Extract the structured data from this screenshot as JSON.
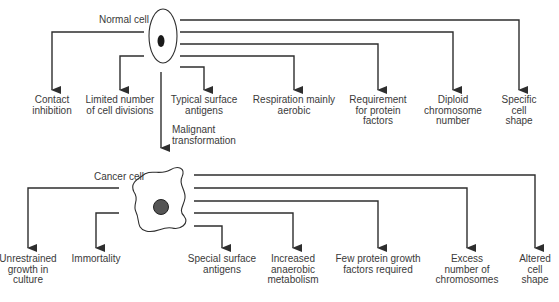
{
  "diagram": {
    "normal_cell": {
      "label": "Normal cell",
      "properties": [
        {
          "id": "contact-inhibition",
          "label": "Contact\ninhibition"
        },
        {
          "id": "limited-divisions",
          "label": "Limited number\nof cell divisions"
        },
        {
          "id": "typical-antigens",
          "label": "Typical surface\nantigens"
        },
        {
          "id": "aerobic-respiration",
          "label": "Respiration mainly\naerobic"
        },
        {
          "id": "protein-factors",
          "label": "Requirement\nfor protein\nfactors"
        },
        {
          "id": "diploid",
          "label": "Diploid\nchromosome\nnumber"
        },
        {
          "id": "specific-shape",
          "label": "Specific\ncell\nshape"
        }
      ]
    },
    "transition": {
      "label": "Malignant\ntransformation"
    },
    "cancer_cell": {
      "label": "Cancer cell",
      "properties": [
        {
          "id": "unrestrained-growth",
          "label": "Unrestrained\ngrowth in\nculture"
        },
        {
          "id": "immortality",
          "label": "Immortality"
        },
        {
          "id": "special-antigens",
          "label": "Special surface\nantigens"
        },
        {
          "id": "anaerobic-metabolism",
          "label": "Increased\nanaerobic\nmetabolism"
        },
        {
          "id": "few-growth-factors",
          "label": "Few protein growth\nfactors required"
        },
        {
          "id": "excess-chromosomes",
          "label": "Excess\nnumber of\nchromosomes"
        },
        {
          "id": "altered-shape",
          "label": "Altered\ncell\nshape"
        }
      ]
    },
    "colors": {
      "line": "#2e2e2e",
      "text": "#3a3a3a",
      "background": "#ffffff"
    }
  }
}
